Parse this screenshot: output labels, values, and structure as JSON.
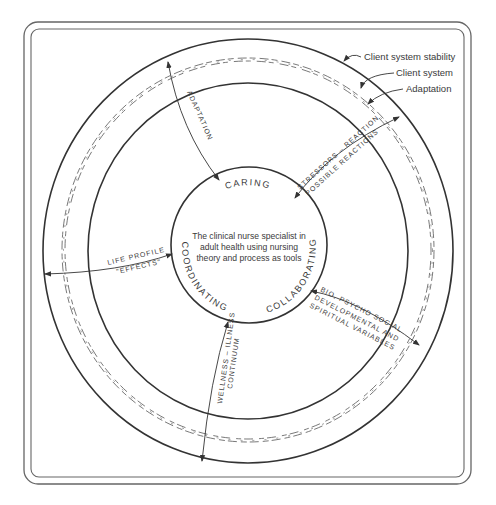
{
  "diagram": {
    "center_text": [
      "The clinical nurse specialist in",
      "adult health using nursing",
      "theory and process as tools"
    ],
    "core_ring_labels": {
      "top": "CARING",
      "left": "COORDINATING",
      "right": "COLLABORATING"
    },
    "legend": {
      "outer_ring": "Client system stability",
      "middle_band": "Client system",
      "wavy_ring": "Adaptation"
    },
    "arrow_labels": {
      "top_left": "ADAPTATION",
      "top_right_line1": "STRESSORS – REACTION",
      "top_right_line2": "POSSIBLE REACTIONS",
      "left_line1": "LIFE PROFILE",
      "left_line2": "\"EFFECTS\"",
      "bottom_line1": "WELLNESS – ILLNESS",
      "bottom_line2": "CONTINUUM",
      "right_line1": "BIO, PSYCHO SOCIAL",
      "right_line2": "DEVELOPMENTAL AND",
      "right_line3": "SPIRITUAL VARIABLES"
    },
    "colors": {
      "line": "#3a3a3a",
      "frame": "#555555",
      "background": "#ffffff"
    }
  }
}
